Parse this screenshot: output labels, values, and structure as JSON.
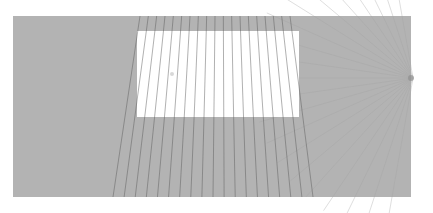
{
  "image": {
    "description": "Abstract photographic image: a gray field with a white rectangular card, crossed by a fan of thin dark lines (strings/wires) converging toward a point on the right edge.",
    "colors": {
      "background": "#ffffff",
      "gray_field": "#b3b3b3",
      "white_card": "#ffffff",
      "lines": "#555555",
      "radial_lines": "#a0a0a0"
    },
    "gray_field": {
      "x": 13,
      "y": 16,
      "w": 398,
      "h": 181
    },
    "white_card": {
      "x": 137,
      "y": 31,
      "w": 162,
      "h": 86
    },
    "convergence_point": {
      "x": 413,
      "y": 78
    },
    "line_count": 19
  }
}
